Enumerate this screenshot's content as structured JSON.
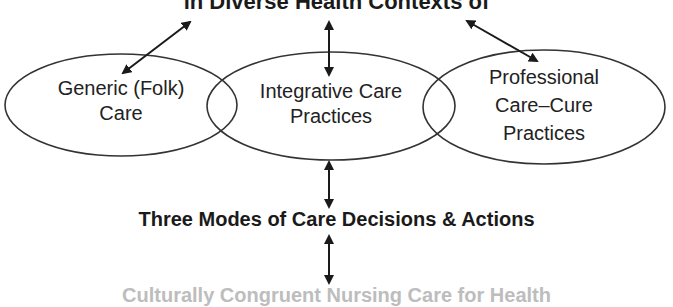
{
  "diagram": {
    "top_title": "in Diverse Health Contexts of",
    "nodes": [
      {
        "id": "generic",
        "label_line1": "Generic (Folk)",
        "label_line2": "Care",
        "label_line3": ""
      },
      {
        "id": "integrative",
        "label_line1": "Integrative Care",
        "label_line2": "Practices",
        "label_line3": ""
      },
      {
        "id": "professional",
        "label_line1": "Professional",
        "label_line2": "Care–Cure",
        "label_line3": "Practices"
      }
    ],
    "middle_title": "Three Modes of Care Decisions & Actions",
    "bottom_text_cut": "Culturally Congruent Nursing Care for Health",
    "colors": {
      "stroke": "#333333",
      "text": "#1a1a1a",
      "background": "#ffffff"
    },
    "edges": [
      {
        "from": "top_title",
        "to": "generic",
        "type": "bidirectional"
      },
      {
        "from": "top_title",
        "to": "integrative",
        "type": "bidirectional"
      },
      {
        "from": "top_title",
        "to": "professional",
        "type": "bidirectional"
      },
      {
        "from": "integrative",
        "to": "middle_title",
        "type": "bidirectional"
      },
      {
        "from": "middle_title",
        "to": "bottom_text_cut",
        "type": "bidirectional"
      }
    ]
  }
}
